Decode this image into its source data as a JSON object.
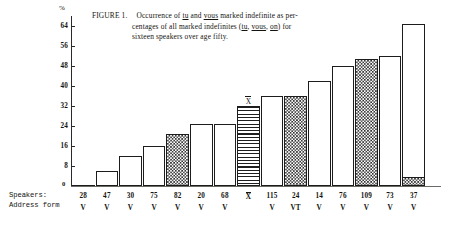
{
  "caption": {
    "figure_label": "FIGURE 1.",
    "line1_a": "Occurrence of ",
    "line1_tu": "tu",
    "line1_b": " and ",
    "line1_vous": "vous",
    "line1_c": " marked indefinite as per-",
    "line2_a": "centages of all marked indefinites (",
    "line2_tu": "tu",
    "line2_b": ", ",
    "line2_vous": "vous",
    "line2_c": ", ",
    "line2_on": "on",
    "line2_d": ") for",
    "line3": "sixteen speakers over age fifty."
  },
  "axes": {
    "y_unit": "%",
    "y_ticks": [
      "64",
      "56",
      "48",
      "40",
      "32",
      "24",
      "16",
      "8"
    ],
    "zero_label": "0",
    "row_label_speakers": "Speakers:",
    "row_label_address": "Address form"
  },
  "chart_data": {
    "type": "bar",
    "xlabel": "Speakers / Address form",
    "ylabel": "%",
    "ylim": [
      0,
      68
    ],
    "grid": false,
    "legend": null,
    "categories": [
      "28",
      "47",
      "30",
      "75",
      "82",
      "20",
      "68",
      "X̄",
      "115",
      "24",
      "14",
      "76",
      "109",
      "73",
      "37"
    ],
    "address_forms": [
      "V",
      "V",
      "V",
      "V",
      "V",
      "V",
      "V",
      "",
      "V",
      "VT",
      "V",
      "V",
      "V",
      "V",
      "V"
    ],
    "values": [
      0,
      6,
      12,
      16,
      21,
      25,
      25,
      32,
      36,
      36,
      42,
      48,
      51,
      52,
      65
    ],
    "fills": [
      "plain",
      "plain",
      "plain",
      "plain",
      "checker",
      "plain",
      "plain",
      "hstripe",
      "plain",
      "checker",
      "plain",
      "plain",
      "checker",
      "plain",
      "plain-with-checker-foot"
    ],
    "foot_values": [
      0,
      0,
      0,
      0,
      0,
      0,
      0,
      0,
      0,
      0,
      0,
      0,
      0,
      0,
      3
    ],
    "mean_marker_index": 7,
    "mean_marker_label": "X"
  }
}
